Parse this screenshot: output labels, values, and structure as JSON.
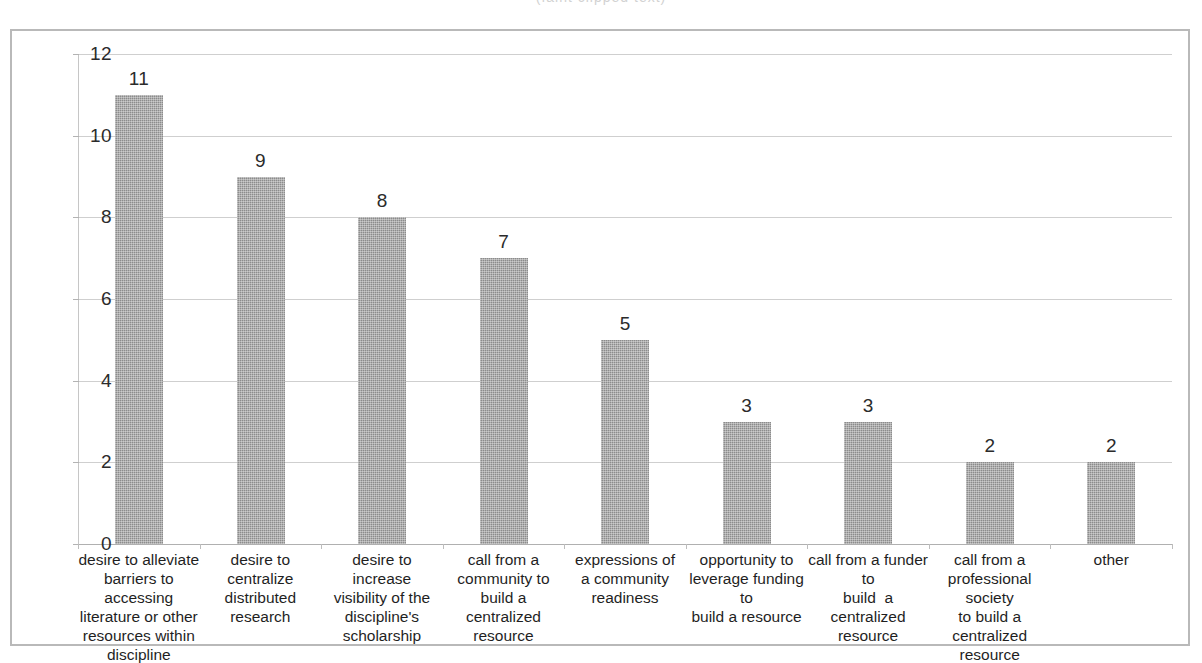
{
  "figure": {
    "clipped_caption_above": "(faint clipped text)",
    "background": "#ffffff",
    "frame_color": "#b9b9b9",
    "bar_color": "#8c8c8c",
    "gridline_color": "#cfcfcf",
    "text_color": "#1f1f1f"
  },
  "chart_data": {
    "type": "bar",
    "title": "",
    "subtitle": "",
    "xlabel": "",
    "ylabel": "",
    "ylim": [
      0,
      12
    ],
    "ytick_labels": [
      "12",
      "10",
      "8",
      "6",
      "4",
      "2",
      "0"
    ],
    "ytick_values": [
      12,
      10,
      8,
      6,
      4,
      2,
      0
    ],
    "grid": true,
    "legend": false,
    "legend_position": "none",
    "categories": [
      "desire to alleviate barriers to accessing literature or other resources within discipline",
      "desire to centralize distributed research",
      "desire to increase visibility of the discipline's scholarship",
      "call from a community to build a centralized resource",
      "expressions of a community readiness",
      "opportunity to leverage funding to build a resource",
      "call from a funder to build  a centralized resource",
      "call from a professional society to build a centralized resource",
      "other"
    ],
    "category_label_lines": [
      "desire to alleviate\nbarriers to accessing\nliterature or other\nresources within\ndiscipline",
      "desire to centralize\ndistributed research",
      "desire to increase\nvisibility of the\ndiscipline's\nscholarship",
      "call from a\ncommunity to build a\ncentralized resource",
      "expressions of\na community readiness",
      "opportunity to\nleverage funding to\nbuild a resource",
      "call from a funder to\nbuild  a centralized\nresource",
      "call from a\nprofessional society\nto build a centralized\nresource",
      "other"
    ],
    "values": [
      11,
      9,
      8,
      7,
      5,
      3,
      3,
      2,
      2
    ],
    "value_labels": [
      "11",
      "9",
      "8",
      "7",
      "5",
      "3",
      "3",
      "2",
      "2"
    ]
  }
}
